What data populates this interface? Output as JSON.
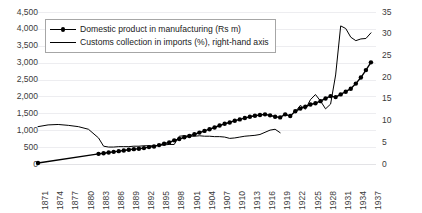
{
  "chart_data": {
    "type": "line",
    "title": "",
    "xlabel": "",
    "ylabel": "",
    "grid": true,
    "legend_position": "top-left",
    "x_tick_labels": [
      "1871",
      "1874",
      "1877",
      "1880",
      "1883",
      "1886",
      "1889",
      "1892",
      "1895",
      "1898",
      "1901",
      "1904",
      "1907",
      "1910",
      "1913",
      "1916",
      "1919",
      "1922",
      "1925",
      "1928",
      "1931",
      "1934",
      "1937"
    ],
    "x_range": [
      1871,
      1938
    ],
    "axes": [
      {
        "id": "left",
        "side": "left",
        "ylim": [
          0,
          4500
        ],
        "ytick_step": 500,
        "ytick_labels": [
          "0",
          "500",
          "1,000",
          "1,500",
          "2,000",
          "2,500",
          "3,000",
          "3,500",
          "4,000",
          "4,500"
        ]
      },
      {
        "id": "right",
        "side": "right",
        "ylim": [
          0,
          35
        ],
        "ytick_step": 5,
        "ytick_labels": [
          "0",
          "5",
          "10",
          "15",
          "20",
          "25",
          "30",
          "35"
        ]
      }
    ],
    "series": [
      {
        "name": "Domestic product in manufacturing (Rs m)",
        "axis": "left",
        "marker": "circle",
        "color": "#000000",
        "line_width": 1.4,
        "x": [
          1871,
          1883,
          1884,
          1885,
          1886,
          1887,
          1888,
          1889,
          1890,
          1891,
          1892,
          1893,
          1894,
          1895,
          1896,
          1897,
          1898,
          1899,
          1900,
          1901,
          1902,
          1903,
          1904,
          1905,
          1906,
          1907,
          1908,
          1909,
          1910,
          1911,
          1912,
          1913,
          1914,
          1915,
          1916,
          1917,
          1918,
          1919,
          1920,
          1921,
          1922,
          1923,
          1924,
          1925,
          1926,
          1927,
          1928,
          1929,
          1930,
          1931,
          1932,
          1933,
          1934,
          1935,
          1936,
          1937
        ],
        "y": [
          30,
          300,
          320,
          340,
          360,
          380,
          400,
          420,
          440,
          450,
          470,
          500,
          520,
          560,
          600,
          640,
          700,
          740,
          790,
          830,
          880,
          930,
          980,
          1030,
          1080,
          1140,
          1190,
          1230,
          1280,
          1320,
          1360,
          1400,
          1430,
          1450,
          1470,
          1440,
          1400,
          1380,
          1470,
          1420,
          1560,
          1640,
          1700,
          1760,
          1800,
          1860,
          1940,
          2010,
          1980,
          2060,
          2140,
          2230,
          2380,
          2560,
          2780,
          3010
        ]
      },
      {
        "name": "Customs collection in imports (%), right-hand axis",
        "axis": "right",
        "marker": "none",
        "color": "#000000",
        "line_width": 1.0,
        "segments": [
          {
            "x": [
              1871,
              1873,
              1875,
              1877,
              1879,
              1881,
              1883,
              1884,
              1885,
              1886,
              1887,
              1888,
              1889,
              1890,
              1891,
              1892,
              1893,
              1894,
              1895,
              1896,
              1897,
              1898,
              1899,
              1900,
              1901,
              1902,
              1903,
              1904,
              1905,
              1906,
              1907,
              1908,
              1909,
              1910,
              1911,
              1912,
              1913,
              1914,
              1915,
              1916,
              1917,
              1918,
              1919
            ],
            "y": [
              8.6,
              9.0,
              9.1,
              8.9,
              8.6,
              8.0,
              6.0,
              4.1,
              3.9,
              3.9,
              4.0,
              4.0,
              4.0,
              4.1,
              4.1,
              4.2,
              4.2,
              4.2,
              4.3,
              4.4,
              4.5,
              4.5,
              6.4,
              6.5,
              6.4,
              6.4,
              6.5,
              6.4,
              6.4,
              6.3,
              6.3,
              6.2,
              5.9,
              6.0,
              6.2,
              6.4,
              6.5,
              6.6,
              6.8,
              7.3,
              7.8,
              8.0,
              7.2
            ]
          },
          {
            "x": [
              1922,
              1923,
              1924,
              1925,
              1926,
              1927,
              1928,
              1929,
              1930,
              1931,
              1932,
              1933,
              1934,
              1935,
              1936,
              1937
            ],
            "y": [
              12.0,
              13.5,
              12.6,
              14.8,
              16.0,
              14.5,
              12.7,
              13.8,
              20.5,
              31.8,
              31.2,
              29.2,
              28.4,
              28.8,
              28.9,
              30.2
            ]
          }
        ]
      }
    ]
  },
  "legend": {
    "items": [
      {
        "label": "Domestic product in manufacturing (Rs m)",
        "key": "line-with-marker"
      },
      {
        "label": "Customs collection in imports (%), right-hand axis",
        "key": "line-plain"
      }
    ]
  }
}
